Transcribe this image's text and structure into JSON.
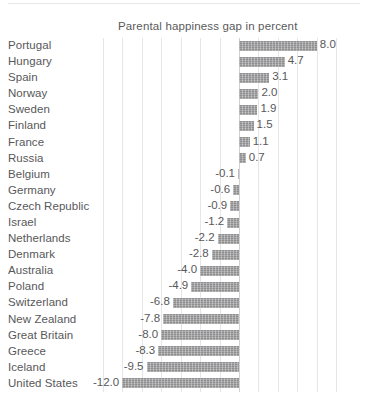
{
  "chart_data": {
    "type": "bar",
    "orientation": "horizontal",
    "title": "Parental happiness gap in percent",
    "xlabel": "",
    "ylabel": "",
    "categories": [
      "Portugal",
      "Hungary",
      "Spain",
      "Norway",
      "Sweden",
      "Finland",
      "France",
      "Russia",
      "Belgium",
      "Germany",
      "Czech Republic",
      "Israel",
      "Netherlands",
      "Denmark",
      "Australia",
      "Poland",
      "Switzerland",
      "New Zealand",
      "Great Britain",
      "Greece",
      "Iceland",
      "United States"
    ],
    "values": [
      8.0,
      4.7,
      3.1,
      2.0,
      1.9,
      1.5,
      1.1,
      0.7,
      -0.1,
      -0.6,
      -0.9,
      -1.2,
      -2.2,
      -2.8,
      -4.0,
      -4.9,
      -6.8,
      -7.8,
      -8.0,
      -8.3,
      -9.5,
      -12.0
    ],
    "value_labels": [
      "8.0",
      "4.7",
      "3.1",
      "2.0",
      "1.9",
      "1.5",
      "1.1",
      "0.7",
      "-0.1",
      "-0.6",
      "-0.9",
      "-1.2",
      "-2.2",
      "-2.8",
      "-4.0",
      "-4.9",
      "-6.8",
      "-7.8",
      "-8.0",
      "-8.3",
      "-9.5",
      "-12.0"
    ],
    "xlim": [
      -15.0,
      11.0
    ],
    "grid": true,
    "grid_step": 2.0,
    "legend": "none",
    "bar_color": "#8e8e90",
    "text_color": "#58585a",
    "grid_color": "#e6e6e6",
    "zero_line_color": "#d2d2d2",
    "background_color": "#ffffff"
  }
}
